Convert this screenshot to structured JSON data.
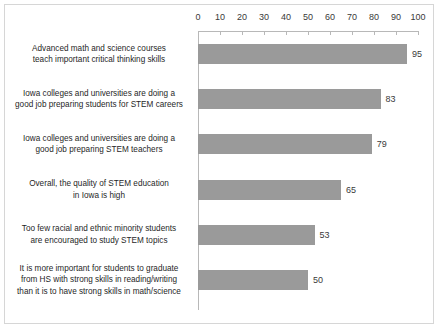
{
  "chart_data": {
    "type": "bar",
    "orientation": "horizontal",
    "title": "",
    "xlabel": "",
    "ylabel": "",
    "xlim": [
      0,
      100
    ],
    "xticks": [
      0,
      10,
      20,
      30,
      40,
      50,
      60,
      70,
      80,
      90,
      100
    ],
    "grid": false,
    "legend": false,
    "bar_color": "#9a9a9a",
    "categories": [
      "Advanced math and science courses teach important critical thinking skills",
      "Iowa colleges and universities are doing a good job preparing students for STEM careers",
      "Iowa colleges and universities are doing a good job preparing STEM teachers",
      "Overall, the quality of STEM education in Iowa is high",
      "Too few racial and ethnic minority students are encouraged to study STEM topics",
      "It is more important for students to graduate from HS with strong skills in reading/writing than it is to have strong skills in math/science"
    ],
    "category_lines": [
      [
        "Advanced math and science courses",
        "teach important critical thinking skills"
      ],
      [
        "Iowa colleges and universities are doing a",
        "good job preparing students for STEM careers"
      ],
      [
        "Iowa colleges and universities are doing a",
        "good job preparing STEM teachers"
      ],
      [
        "Overall, the quality of STEM education",
        "in Iowa is high"
      ],
      [
        "Too few racial and ethnic minority students",
        "are encouraged to study STEM topics"
      ],
      [
        "It is more important for students to graduate",
        "from HS with strong skills in reading/writing",
        "than it is to have strong skills in math/science"
      ]
    ],
    "values": [
      95,
      83,
      79,
      65,
      53,
      50
    ],
    "value_labels": [
      "95",
      "83",
      "79",
      "65",
      "53",
      "50"
    ]
  }
}
